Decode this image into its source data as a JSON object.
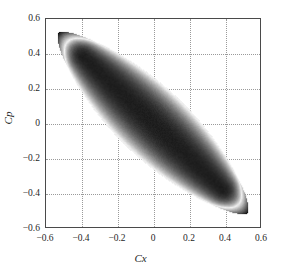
{
  "chart_data": {
    "type": "heatmap",
    "title": "",
    "subtitle": "",
    "xlabel": "Cx",
    "ylabel": "Cp",
    "xlim": [
      -0.6,
      0.6
    ],
    "ylim": [
      -0.6,
      0.6
    ],
    "xticks": [
      "-0.6",
      "-0.4",
      "-0.2",
      "0",
      "0.2",
      "0.4",
      "0.6"
    ],
    "xtick_values": [
      -0.6,
      -0.4,
      -0.2,
      0,
      0.2,
      0.4,
      0.6
    ],
    "yticks": [
      "0.6",
      "0.4",
      "0.2",
      "0",
      "-0.2",
      "-0.4",
      "-0.6"
    ],
    "ytick_values": [
      0.6,
      0.4,
      0.2,
      0,
      -0.2,
      -0.4,
      -0.6
    ],
    "grid": true,
    "grid_style": "dotted",
    "grid_color": "#9a9a9a",
    "legend_position": "inside-top-right",
    "colormap": "gray-banded",
    "colorbar": {
      "ticks": [
        "0.4",
        "0.35",
        "0.3",
        "0.25",
        "0.2",
        "0.15"
      ],
      "tick_values": [
        0.4,
        0.35,
        0.3,
        0.25,
        0.2,
        0.15
      ],
      "vmin": 0.15,
      "vmax": 0.4,
      "orientation": "vertical"
    },
    "region": {
      "shape": "lens",
      "description": "Lens / eye shaped region spanning from upper-left tip to lower-right tip along the anti-diagonal",
      "tip_1": [
        -0.53,
        0.52
      ],
      "tip_2": [
        0.53,
        -0.52
      ],
      "major_axis_angle_deg": -45,
      "half_width": 0.2
    },
    "field_values": {
      "tips": 0.4,
      "edge_band": 0.26,
      "core": 0.16,
      "description": "Value is highest (dark, 0.4) at the two pointed tips, drops through a light band (~0.25-0.3) just inside the lens boundary, then becomes dark again (~0.15-0.18) through the broad elliptical core"
    }
  },
  "colors": {
    "background": "#ffffff",
    "frame": "#4a4a4a",
    "text": "#1f1f1f",
    "grid": "#9a9a9a",
    "colorbar_border": "#333333"
  }
}
